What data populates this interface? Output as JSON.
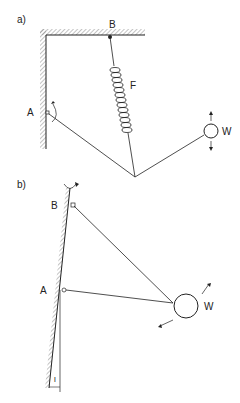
{
  "diagram_a": {
    "panel_label": "a)",
    "point_b": "B",
    "point_a": "A",
    "spring": "F",
    "weight": "W"
  },
  "diagram_b": {
    "panel_label": "b)",
    "point_b": "B",
    "point_a": "A",
    "weight": "W",
    "offset_label": "l"
  },
  "colors": {
    "line": "#222222",
    "hatch": "#888888"
  }
}
